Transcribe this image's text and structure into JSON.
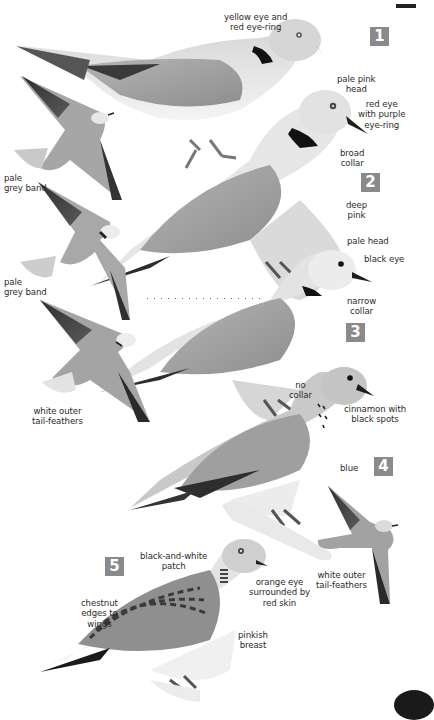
{
  "page": {
    "type": "field-guide plate",
    "palette": {
      "background": "#ffffff",
      "badge": "#8a8a8a",
      "badge_text": "#ffffff",
      "label_text": "#2b2b2b",
      "plumage_light": "#e4e4e4",
      "plumage_mid": "#a9a9a9",
      "plumage_dark": "#3a3a3a"
    }
  },
  "badges": [
    {
      "number": "1"
    },
    {
      "number": "2"
    },
    {
      "number": "3"
    },
    {
      "number": "4"
    },
    {
      "number": "5"
    }
  ],
  "labels": {
    "species1_eye": "yellow eye and\nred eye-ring",
    "flight1_band": "pale\ngrey band",
    "species2_head": "pale pink\nhead",
    "species2_eye": "red eye\nwith purple\neye-ring",
    "species2_collar": "broad\ncollar",
    "species2_body": "deep\npink",
    "flight2_band": "pale\ngrey band",
    "species3_head": "pale head",
    "species3_eye": "black eye",
    "species3_collar": "narrow\ncollar",
    "flight3_tail": "white outer\ntail-feathers",
    "species4_collar": "no\ncollar",
    "species4_neck": "cinnamon with\nblack spots",
    "species4_body": "blue",
    "flight4_tail": "white outer\ntail-feathers",
    "species5_patch": "black-and-white\npatch",
    "species5_eye": "orange eye\nsurrounded by\nred skin",
    "species5_wings": "chestnut\nedges to\nwings",
    "species5_breast": "pinkish\nbreast"
  }
}
